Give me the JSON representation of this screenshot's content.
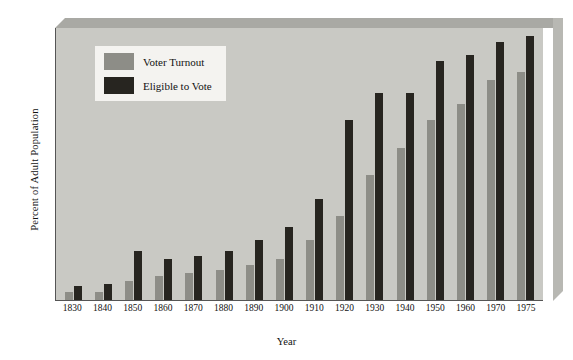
{
  "chart_data": {
    "type": "bar",
    "title": "",
    "xlabel": "Year",
    "ylabel": "Percent of Adult Population",
    "ylim": [
      0,
      100
    ],
    "yticks": [
      0,
      20,
      40,
      60,
      80,
      100
    ],
    "grid": false,
    "legend_position": "inside-top-left",
    "categories": [
      "1830",
      "1840",
      "1850",
      "1860",
      "1870",
      "1880",
      "1890",
      "1900",
      "1910",
      "1920",
      "1930",
      "1940",
      "1950",
      "1960",
      "1970",
      "1975"
    ],
    "series": [
      {
        "name": "Voter Turnout",
        "color": "#8d8d87",
        "values": [
          3,
          3,
          7,
          9,
          10,
          11,
          13,
          15,
          22,
          31,
          46,
          56,
          66,
          72,
          81,
          84
        ]
      },
      {
        "name": "Eligible to Vote",
        "color": "#272520",
        "values": [
          5,
          6,
          18,
          15,
          16,
          18,
          22,
          27,
          37,
          66,
          76,
          76,
          88,
          90,
          95,
          97
        ]
      }
    ]
  },
  "legend": {
    "items": [
      {
        "label": "Voter Turnout"
      },
      {
        "label": "Eligible to Vote"
      }
    ]
  },
  "colors": {
    "turnout": "#8d8d87",
    "eligible": "#272520",
    "plot_background": "#c9c9c4",
    "legend_background": "#f4f3f0"
  }
}
